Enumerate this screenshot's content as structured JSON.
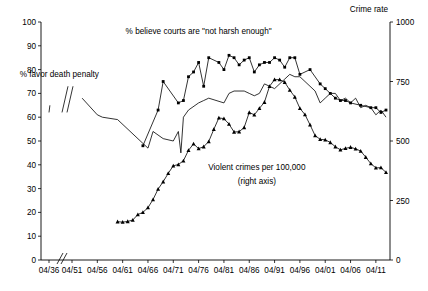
{
  "chart_data": {
    "type": "line",
    "title": "",
    "xlabel": "",
    "ylabel": "",
    "y2label": "Crime rate",
    "ylim": [
      0,
      100
    ],
    "y2lim": [
      0,
      1000
    ],
    "grid": false,
    "legend_position": "inline-annotations",
    "x_tick_labels": [
      "04/36",
      "04/51",
      "04/56",
      "04/61",
      "04/66",
      "04/71",
      "04/76",
      "04/81",
      "04/86",
      "04/91",
      "04/96",
      "04/01",
      "04/06",
      "04/11"
    ],
    "x_tick_years": [
      1936,
      1951,
      1956,
      1961,
      1966,
      1971,
      1976,
      1981,
      1986,
      1991,
      1996,
      2001,
      2006,
      2011
    ],
    "x_axis_break": true,
    "x_axis_break_between": [
      "04/36",
      "04/51"
    ],
    "y_tick_labels": [
      "0",
      "10",
      "20",
      "30",
      "40",
      "50",
      "60",
      "70",
      "80",
      "90",
      "100"
    ],
    "y_tick_values": [
      0,
      10,
      20,
      30,
      40,
      50,
      60,
      70,
      80,
      90,
      100
    ],
    "y2_tick_labels": [
      "0",
      "250",
      "500",
      "750",
      "1000"
    ],
    "y2_tick_values": [
      0,
      250,
      500,
      750,
      1000
    ],
    "annotations": [
      {
        "name": "death-penalty-label",
        "text": "% favor death penalty",
        "x": 1948.5,
        "y": 77
      },
      {
        "name": "courts-harsh-label",
        "text": "% believe courts are \"not harsh enough\"",
        "x": 1976.0,
        "y": 95
      },
      {
        "name": "violent-crime-label-line1",
        "text": "Violent crimes per 100,000",
        "x": 1987.5,
        "y": 38
      },
      {
        "name": "violent-crime-label-line2",
        "text": "(right axis)",
        "x": 1987.5,
        "y": 32
      }
    ],
    "series": [
      {
        "name": "% favor death penalty",
        "axis": "left",
        "marker": "none",
        "color": "#000000",
        "x": [
          1936,
          1937,
          1953,
          1956,
          1957,
          1960,
          1965,
          1966,
          1967,
          1969,
          1971,
          1972,
          1972.5,
          1973,
          1974,
          1976,
          1977,
          1978,
          1981,
          1982,
          1983,
          1985,
          1986,
          1987,
          1988,
          1989,
          1990,
          1991,
          1993,
          1994,
          1995,
          1996,
          1997,
          1999,
          2000,
          2001,
          2002,
          2003,
          2004,
          2005,
          2006,
          2007,
          2008,
          2009,
          2010,
          2011,
          2012,
          2013
        ],
        "y": [
          62,
          65,
          68,
          61,
          60,
          59,
          49,
          47,
          54,
          51,
          50,
          54,
          45,
          60,
          63,
          66,
          67,
          68,
          66,
          70,
          71,
          71,
          70,
          69,
          70,
          74,
          73,
          72,
          76,
          78,
          77,
          77,
          75,
          71,
          66,
          68,
          70,
          70,
          67,
          68,
          66,
          68,
          64,
          65,
          64,
          61,
          63,
          60
        ]
      },
      {
        "name": "% believe courts are \"not harsh enough\"",
        "axis": "left",
        "marker": "square",
        "color": "#000000",
        "x": [
          1965,
          1968,
          1969,
          1972,
          1973,
          1974,
          1975,
          1976,
          1977,
          1978,
          1980,
          1981,
          1982,
          1983,
          1984,
          1985,
          1986,
          1987,
          1988,
          1989,
          1990,
          1991,
          1992,
          1993,
          1994,
          1995,
          1996,
          1998,
          2000,
          2001,
          2002,
          2003,
          2004,
          2005,
          2006,
          2008,
          2010,
          2011,
          2012,
          2013
        ],
        "y": [
          48,
          63,
          75,
          66,
          67,
          77,
          79,
          83,
          73,
          85,
          83,
          80,
          86,
          85,
          82,
          84,
          85,
          79,
          82,
          83,
          83,
          85,
          84,
          81,
          85,
          85,
          78,
          80,
          74,
          72,
          70,
          68,
          67,
          67,
          66,
          65,
          64,
          64,
          62,
          63
        ]
      },
      {
        "name": "Violent crimes per 100,000 (right axis)",
        "axis": "right",
        "marker": "triangle",
        "color": "#000000",
        "x": [
          1960,
          1961,
          1962,
          1963,
          1964,
          1965,
          1966,
          1967,
          1968,
          1969,
          1970,
          1971,
          1972,
          1973,
          1974,
          1975,
          1976,
          1977,
          1978,
          1979,
          1980,
          1981,
          1982,
          1983,
          1984,
          1985,
          1986,
          1987,
          1988,
          1989,
          1990,
          1991,
          1992,
          1993,
          1994,
          1995,
          1996,
          1997,
          1998,
          1999,
          2000,
          2001,
          2002,
          2003,
          2004,
          2005,
          2006,
          2007,
          2008,
          2009,
          2010,
          2011,
          2012,
          2013
        ],
        "y": [
          161,
          159,
          162,
          168,
          191,
          200,
          220,
          254,
          298,
          329,
          364,
          396,
          401,
          417,
          461,
          488,
          468,
          476,
          498,
          549,
          597,
          594,
          571,
          538,
          539,
          557,
          620,
          610,
          637,
          663,
          730,
          758,
          758,
          747,
          714,
          685,
          637,
          611,
          568,
          523,
          507,
          505,
          494,
          476,
          463,
          469,
          474,
          467,
          458,
          432,
          405,
          387,
          388,
          368
        ]
      }
    ]
  }
}
